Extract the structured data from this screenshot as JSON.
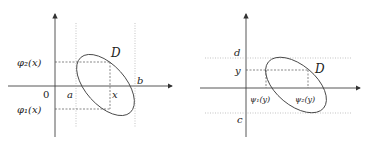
{
  "left_diagram": {
    "region_label": "D",
    "origin_label": "0",
    "x_bounds": {
      "a": "a",
      "b": "b"
    },
    "x_label": "x",
    "upper_curve_label": "φ₂(x)",
    "lower_curve_label": "φ₁(x)"
  },
  "right_diagram": {
    "region_label": "D",
    "y_bounds": {
      "c": "c",
      "d": "d"
    },
    "y_label": "y",
    "left_curve_label": "ψ₁(y)",
    "right_curve_label": "ψ₂(y)"
  },
  "colors": {
    "axis": "#333333",
    "guide": "#999999",
    "curve": "#444444"
  }
}
